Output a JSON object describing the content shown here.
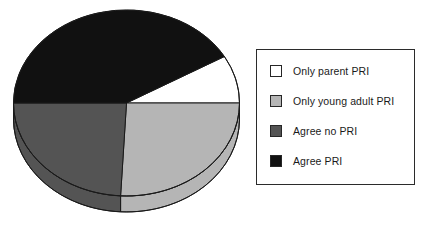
{
  "chart_data": {
    "type": "pie",
    "title": "",
    "subtitle": "",
    "xlabel": "",
    "ylabel": "",
    "three_d": true,
    "start_angle_deg": -30,
    "direction": "clockwise",
    "legend_position": "right",
    "grid": false,
    "categories": [
      "Only parent PRI",
      "Only young adult PRI",
      "Agree no PRI",
      "Agree PRI"
    ],
    "values": [
      8,
      26,
      24,
      42
    ],
    "colors": [
      "#ffffff",
      "#b5b5b5",
      "#545454",
      "#111111"
    ],
    "slices": [
      {
        "label": "Only parent PRI",
        "value": 8,
        "color": "#ffffff",
        "start_deg": -30,
        "end_deg": 0
      },
      {
        "label": "Only young adult PRI",
        "value": 26,
        "color": "#b5b5b5",
        "start_deg": 0,
        "end_deg": 93
      },
      {
        "label": "Agree no PRI",
        "value": 24,
        "color": "#545454",
        "start_deg": 93,
        "end_deg": 180
      },
      {
        "label": "Agree PRI",
        "value": 42,
        "color": "#111111",
        "start_deg": 180,
        "end_deg": 330
      }
    ]
  },
  "legend": {
    "items": [
      {
        "label": "Only parent PRI",
        "color": "#ffffff"
      },
      {
        "label": "Only young adult PRI",
        "color": "#b5b5b5"
      },
      {
        "label": "Agree no PRI",
        "color": "#545454"
      },
      {
        "label": "Agree PRI",
        "color": "#111111"
      }
    ]
  }
}
